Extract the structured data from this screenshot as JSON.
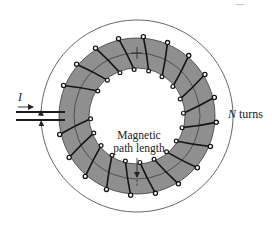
{
  "figure": {
    "type": "toroidal-coil-diagram",
    "labels": {
      "current": "I",
      "turns_var": "N",
      "turns_word": " turns",
      "magnetic_path_line1": "Magnetic",
      "magnetic_path_line2": "path length"
    },
    "geometry": {
      "center": [
        137,
        116
      ],
      "core_outer_radius": 78,
      "core_inner_radius": 48,
      "mean_path_radius": 63,
      "enclosing_arc_radius": 96,
      "winding_count": 20
    },
    "colors": {
      "core_fill": "#8f8f8f",
      "core_outline": "#3a3a3a",
      "winding": "#151515",
      "arc": "#555555",
      "background": "#ffffff"
    }
  }
}
